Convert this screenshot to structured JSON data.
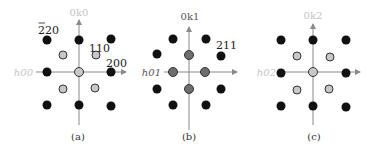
{
  "colors": {
    "axis": "#8a8a8a",
    "dot_black": "#111111",
    "dot_light": "#c8c8c8",
    "dot_gray": "#6e6e6e",
    "dot_outline": "#333333",
    "label_dark": "#222222",
    "label_faint": "#c4c4c4",
    "label_mid": "#777777"
  },
  "panels": [
    {
      "caption": "(a)",
      "v_axis_label": "0k0",
      "h_axis_label": "h00",
      "spot_labels": [
        {
          "text": "220",
          "overbar_first": true
        },
        {
          "text": "110",
          "overbar_first": false
        },
        {
          "text": "200",
          "overbar_first": false
        }
      ]
    },
    {
      "caption": "(b)",
      "v_axis_label": "0k1",
      "h_axis_label": "h01",
      "spot_labels": [
        {
          "text": "211",
          "overbar_first": false
        }
      ]
    },
    {
      "caption": "(c)",
      "v_axis_label": "0k2",
      "h_axis_label": "h02",
      "spot_labels": []
    }
  ]
}
